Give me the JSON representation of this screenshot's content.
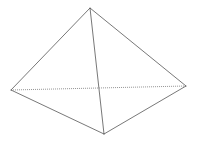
{
  "diagram": {
    "title": "",
    "type": "pyramid-wireframe",
    "stroke_color": "#555555",
    "hidden_stroke_color": "#888888",
    "vertices": {
      "apex": [
        90,
        8
      ],
      "left": [
        11,
        90
      ],
      "right": [
        186,
        86
      ],
      "front": [
        104,
        134
      ]
    },
    "edges": [
      {
        "from": "apex",
        "to": "left",
        "style": "solid"
      },
      {
        "from": "apex",
        "to": "right",
        "style": "solid"
      },
      {
        "from": "apex",
        "to": "front",
        "style": "solid"
      },
      {
        "from": "left",
        "to": "front",
        "style": "solid"
      },
      {
        "from": "front",
        "to": "right",
        "style": "solid"
      },
      {
        "from": "left",
        "to": "right",
        "style": "dotted"
      }
    ]
  }
}
